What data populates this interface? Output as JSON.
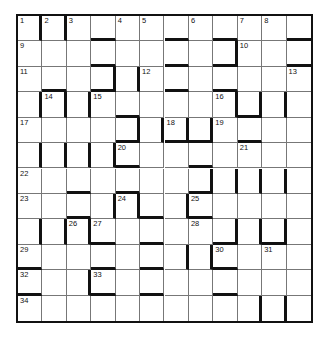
{
  "puzzle": {
    "type": "barred-crossword",
    "rows": 12,
    "cols": 12,
    "numbers": [
      {
        "n": "1",
        "r": 1,
        "c": 1
      },
      {
        "n": "2",
        "r": 1,
        "c": 2
      },
      {
        "n": "3",
        "r": 1,
        "c": 3
      },
      {
        "n": "4",
        "r": 1,
        "c": 5
      },
      {
        "n": "5",
        "r": 1,
        "c": 6
      },
      {
        "n": "6",
        "r": 1,
        "c": 8
      },
      {
        "n": "7",
        "r": 1,
        "c": 10
      },
      {
        "n": "8",
        "r": 1,
        "c": 11
      },
      {
        "n": "9",
        "r": 2,
        "c": 1
      },
      {
        "n": "10",
        "r": 2,
        "c": 10
      },
      {
        "n": "11",
        "r": 3,
        "c": 1
      },
      {
        "n": "12",
        "r": 3,
        "c": 6
      },
      {
        "n": "13",
        "r": 3,
        "c": 12
      },
      {
        "n": "14",
        "r": 4,
        "c": 2
      },
      {
        "n": "15",
        "r": 4,
        "c": 4
      },
      {
        "n": "16",
        "r": 4,
        "c": 9
      },
      {
        "n": "17",
        "r": 5,
        "c": 1
      },
      {
        "n": "18",
        "r": 5,
        "c": 7
      },
      {
        "n": "19",
        "r": 5,
        "c": 9
      },
      {
        "n": "20",
        "r": 6,
        "c": 5
      },
      {
        "n": "21",
        "r": 6,
        "c": 10
      },
      {
        "n": "22",
        "r": 7,
        "c": 1
      },
      {
        "n": "23",
        "r": 8,
        "c": 1
      },
      {
        "n": "24",
        "r": 8,
        "c": 5
      },
      {
        "n": "25",
        "r": 8,
        "c": 8
      },
      {
        "n": "26",
        "r": 9,
        "c": 3
      },
      {
        "n": "27",
        "r": 9,
        "c": 4
      },
      {
        "n": "28",
        "r": 9,
        "c": 8
      },
      {
        "n": "29",
        "r": 10,
        "c": 1
      },
      {
        "n": "30",
        "r": 10,
        "c": 9
      },
      {
        "n": "31",
        "r": 10,
        "c": 11
      },
      {
        "n": "32",
        "r": 11,
        "c": 1
      },
      {
        "n": "33",
        "r": 11,
        "c": 4
      },
      {
        "n": "34",
        "r": 12,
        "c": 1
      }
    ],
    "bars_right": {
      "1": [
        1,
        2
      ],
      "2": [
        9
      ],
      "3": [
        4,
        5
      ],
      "4": [
        1,
        2,
        3,
        9,
        10,
        11
      ],
      "5": [
        5,
        6,
        7,
        8
      ],
      "6": [
        1,
        2,
        3,
        4
      ],
      "7": [
        8,
        9,
        10,
        11
      ],
      "8": [
        4,
        5,
        7
      ],
      "9": [
        1,
        2,
        3,
        9,
        10,
        11
      ],
      "10": [
        7,
        8
      ],
      "11": [
        3
      ],
      "12": [
        10,
        11
      ]
    },
    "bars_bottom": {
      "1": [
        4,
        7,
        9,
        12
      ],
      "2": [
        4,
        7,
        9,
        12
      ],
      "3": [
        2,
        4,
        7,
        9
      ],
      "4": [
        5,
        10
      ],
      "5": [
        5,
        7,
        8,
        10
      ],
      "6": [
        5,
        8
      ],
      "7": [
        3,
        5,
        8
      ],
      "8": [
        3,
        6,
        8
      ],
      "9": [
        4,
        6,
        9,
        11
      ],
      "10": [
        1,
        4,
        6,
        9
      ],
      "11": [
        1,
        4,
        6,
        9
      ]
    }
  }
}
